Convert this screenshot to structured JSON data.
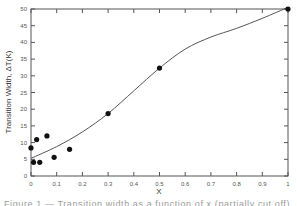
{
  "chart_data": {
    "type": "scatter",
    "title": "",
    "xlabel": "X",
    "ylabel": "Transition Width, ΔT(K)",
    "xlim": [
      0,
      1
    ],
    "ylim": [
      0,
      50
    ],
    "xticks": [
      "0",
      "0.1",
      "0.2",
      "0.3",
      "0.4",
      "0.5",
      "0.6",
      "0.7",
      "0.8",
      "0.9",
      "1"
    ],
    "xtick_values": [
      0,
      0.1,
      0.2,
      0.3,
      0.4,
      0.5,
      0.6,
      0.7,
      0.8,
      0.9,
      1
    ],
    "yticks": [
      "0",
      "5",
      "10",
      "15",
      "20",
      "25",
      "30",
      "35",
      "40",
      "45",
      "50"
    ],
    "ytick_values": [
      0,
      5,
      10,
      15,
      20,
      25,
      30,
      35,
      40,
      45,
      50
    ],
    "grid": false,
    "legend": "none",
    "series": [
      {
        "name": "measured",
        "kind": "scatter",
        "color": "#111111",
        "points": [
          {
            "x": 0.0,
            "y": 8.4
          },
          {
            "x": 0.01,
            "y": 4.1
          },
          {
            "x": 0.022,
            "y": 10.9
          },
          {
            "x": 0.034,
            "y": 4.1
          },
          {
            "x": 0.062,
            "y": 12.0
          },
          {
            "x": 0.09,
            "y": 5.6
          },
          {
            "x": 0.15,
            "y": 8.0
          },
          {
            "x": 0.3,
            "y": 18.7
          },
          {
            "x": 0.5,
            "y": 32.3
          },
          {
            "x": 1.0,
            "y": 50.5
          }
        ]
      },
      {
        "name": "fit",
        "kind": "line",
        "color": "#555555",
        "points": [
          {
            "x": 0.0,
            "y": 5.3
          },
          {
            "x": 0.1,
            "y": 8.8
          },
          {
            "x": 0.2,
            "y": 13.2
          },
          {
            "x": 0.3,
            "y": 18.7
          },
          {
            "x": 0.4,
            "y": 25.5
          },
          {
            "x": 0.5,
            "y": 32.3
          },
          {
            "x": 0.6,
            "y": 38.0
          },
          {
            "x": 0.7,
            "y": 41.6
          },
          {
            "x": 0.8,
            "y": 44.2
          },
          {
            "x": 0.9,
            "y": 47.2
          },
          {
            "x": 1.0,
            "y": 50.5
          }
        ]
      }
    ]
  },
  "caption": "Figure 1 — Transition width as a function of x (partially cut off)"
}
